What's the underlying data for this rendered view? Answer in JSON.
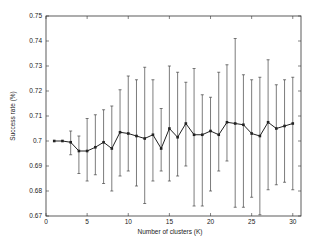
{
  "chart_data": {
    "type": "line",
    "title": "",
    "xlabel": "Number of clusters (K)",
    "ylabel": "Success rate (%)",
    "xlim": [
      0,
      31
    ],
    "ylim": [
      0.67,
      0.75
    ],
    "xticks": [
      0,
      5,
      10,
      15,
      20,
      25,
      30
    ],
    "yticks": [
      0.67,
      0.68,
      0.69,
      0.7,
      0.71,
      0.72,
      0.73,
      0.74,
      0.75
    ],
    "ytick_labels": [
      "0.67",
      "0.68",
      "0.69",
      "0.7",
      "0.71",
      "0.72",
      "0.73",
      "0.74",
      "0.75"
    ],
    "grid": false,
    "legend": null,
    "error_bars": true,
    "series": [
      {
        "name": "Success rate",
        "x": [
          1,
          2,
          3,
          4,
          5,
          6,
          7,
          8,
          9,
          10,
          11,
          12,
          13,
          14,
          15,
          16,
          17,
          18,
          19,
          20,
          21,
          22,
          23,
          24,
          25,
          26,
          27,
          28,
          29,
          30
        ],
        "values": [
          0.7,
          0.7,
          0.6995,
          0.696,
          0.696,
          0.6975,
          0.6995,
          0.697,
          0.7035,
          0.703,
          0.702,
          0.701,
          0.7025,
          0.697,
          0.705,
          0.7015,
          0.707,
          0.7025,
          0.7025,
          0.704,
          0.7025,
          0.7075,
          0.707,
          0.7065,
          0.703,
          0.702,
          0.7075,
          0.705,
          0.706,
          0.707
        ],
        "lower": [
          0.7,
          0.7,
          0.6945,
          0.687,
          0.684,
          0.6865,
          0.683,
          0.68,
          0.686,
          0.688,
          0.682,
          0.675,
          0.684,
          0.688,
          0.684,
          0.686,
          0.69,
          0.674,
          0.674,
          0.68,
          0.688,
          0.692,
          0.6735,
          0.6735,
          0.6775,
          0.6705,
          0.6805,
          0.6825,
          0.6835,
          0.6805
        ],
        "upper": [
          0.7,
          0.7,
          0.704,
          0.702,
          0.709,
          0.7105,
          0.7125,
          0.714,
          0.7205,
          0.726,
          0.7245,
          0.7295,
          0.7245,
          0.713,
          0.73,
          0.7275,
          0.7235,
          0.729,
          0.7185,
          0.7175,
          0.7275,
          0.7305,
          0.741,
          0.7265,
          0.7245,
          0.7255,
          0.7325,
          0.7225,
          0.7245,
          0.7255
        ]
      }
    ]
  }
}
